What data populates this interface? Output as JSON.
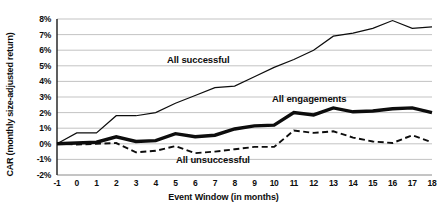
{
  "chart_data": {
    "type": "line",
    "title": "",
    "xlabel": "Event Window (in months)",
    "ylabel": "CAR (monthly size-adjusted return)",
    "xlim": [
      -1,
      18
    ],
    "ylim": [
      -2,
      8
    ],
    "grid": true,
    "legend_position": "inline-annotations",
    "x": [
      -1,
      0,
      1,
      2,
      3,
      4,
      5,
      6,
      7,
      8,
      9,
      10,
      11,
      12,
      13,
      14,
      15,
      16,
      17,
      18
    ],
    "x_tick_labels": [
      "-1",
      "0",
      "1",
      "2",
      "3",
      "4",
      "5",
      "6",
      "7",
      "8",
      "9",
      "10",
      "11",
      "12",
      "13",
      "14",
      "15",
      "16",
      "17",
      "18"
    ],
    "y_tick_labels": [
      "8%",
      "7%",
      "6%",
      "5%",
      "4%",
      "3%",
      "2%",
      "1%",
      "0%",
      "-1%",
      "-2%"
    ],
    "y_ticks": [
      8,
      7,
      6,
      5,
      4,
      3,
      2,
      1,
      0,
      -1,
      -2
    ],
    "series": [
      {
        "name": "All successful",
        "style": "thin-solid",
        "color": "#0d0d0d",
        "values": [
          0.0,
          0.7,
          0.7,
          1.8,
          1.8,
          2.0,
          2.6,
          3.1,
          3.6,
          3.7,
          4.3,
          4.9,
          5.4,
          6.0,
          6.9,
          7.1,
          7.4,
          7.9,
          7.4,
          7.5
        ]
      },
      {
        "name": "All engagements",
        "style": "thick-solid",
        "color": "#0d0d0d",
        "values": [
          0.0,
          0.05,
          0.1,
          0.45,
          0.15,
          0.2,
          0.65,
          0.45,
          0.55,
          0.95,
          1.15,
          1.2,
          2.0,
          1.85,
          2.3,
          2.05,
          2.1,
          2.25,
          2.3,
          2.0
        ]
      },
      {
        "name": "All unsuccessful",
        "style": "dashed",
        "color": "#0d0d0d",
        "values": [
          0.0,
          -0.05,
          0.0,
          0.05,
          -0.55,
          -0.45,
          -0.15,
          -0.6,
          -0.5,
          -0.35,
          -0.2,
          -0.2,
          0.85,
          0.7,
          0.8,
          0.4,
          0.15,
          0.05,
          0.55,
          0.1
        ]
      }
    ],
    "annotations": [
      {
        "text": "All successful",
        "x": 6.5,
        "y": 5.1
      },
      {
        "text": "All engagements",
        "x": 12.0,
        "y": 2.8
      },
      {
        "text": "All unsuccessful",
        "x": 7.2,
        "y": -1.3
      }
    ]
  }
}
